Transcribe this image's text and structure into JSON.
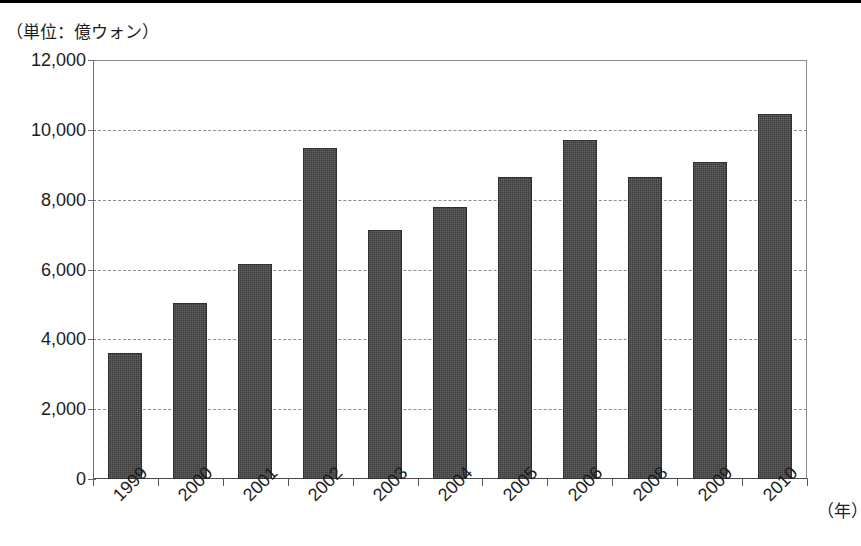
{
  "figure": {
    "unit_caption": "（単位：億ウォン）",
    "xaxis_title": "（年）"
  },
  "chart_data": {
    "type": "bar",
    "title": "",
    "subtitle": "",
    "xlabel": "（年）",
    "ylabel": "（単位：億ウォン）",
    "categories": [
      "1999",
      "2000",
      "2001",
      "2002",
      "2003",
      "2004",
      "2005",
      "2006",
      "2008",
      "2009",
      "2010"
    ],
    "values": [
      3620,
      5050,
      6150,
      9490,
      7130,
      7790,
      8640,
      9710,
      8640,
      9090,
      10460
    ],
    "series": [
      {
        "name": "金額",
        "values": [
          3620,
          5050,
          6150,
          9490,
          7130,
          7790,
          8640,
          9710,
          8640,
          9090,
          10460
        ]
      }
    ],
    "ylim": [
      0,
      12000
    ],
    "yticks": [
      0,
      2000,
      4000,
      6000,
      8000,
      10000,
      12000
    ],
    "ytick_labels": [
      "0",
      "2,000",
      "4,000",
      "6,000",
      "8,000",
      "10,000",
      "12,000"
    ],
    "grid": true,
    "grid_axis": "y",
    "grid_style": "dashed",
    "legend": false,
    "legend_position": "none",
    "bar_color": "#3b3b3b",
    "background_color": "#ffffff",
    "xtick_label_rotation": -45,
    "note": "2007年はデータなし"
  }
}
